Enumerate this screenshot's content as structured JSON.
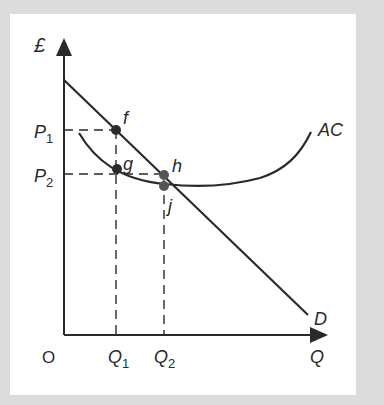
{
  "diagram": {
    "y_axis_label": "£",
    "x_axis_label": "Q",
    "origin_label": "O",
    "price_labels": [
      {
        "main": "P",
        "sub": "1"
      },
      {
        "main": "P",
        "sub": "2"
      }
    ],
    "quantity_labels": [
      {
        "main": "Q",
        "sub": "1"
      },
      {
        "main": "Q",
        "sub": "2"
      }
    ],
    "curves": [
      {
        "name": "AC",
        "label": "AC"
      },
      {
        "name": "D",
        "label": "D"
      }
    ],
    "points": [
      {
        "label": "f"
      },
      {
        "label": "g"
      },
      {
        "label": "h"
      },
      {
        "label": "j"
      }
    ],
    "colors": {
      "background": "#dcdcdc",
      "panel": "#ffffff",
      "line": "#2a2a2a",
      "point": "#2a2a2a",
      "point_secondary": "#555555"
    }
  }
}
